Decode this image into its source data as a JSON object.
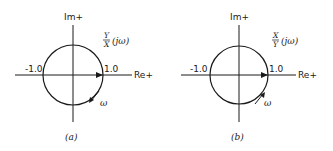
{
  "figure": {
    "panels": [
      {
        "id": "a",
        "caption": "(a)",
        "imag_axis_label": "Im+",
        "real_axis_label": "Re+",
        "neg_tick_label": "-1.0",
        "pos_tick_label": "1.0",
        "function_numerator": "Y",
        "function_denominator": "X",
        "function_argument": "(jω)",
        "omega_label": "ω",
        "omega_direction": "clockwise-down-left",
        "circle": {
          "cx": 73,
          "cy": 75,
          "r": 30
        }
      },
      {
        "id": "b",
        "caption": "(b)",
        "imag_axis_label": "Im+",
        "real_axis_label": "Re+",
        "neg_tick_label": "-1.0",
        "pos_tick_label": "1.0",
        "function_numerator": "X",
        "function_denominator": "Y",
        "function_argument": "(jω)",
        "omega_label": "ω",
        "omega_direction": "counterclockwise-up-right",
        "circle": {
          "cx": 239,
          "cy": 75,
          "r": 29
        }
      }
    ]
  }
}
